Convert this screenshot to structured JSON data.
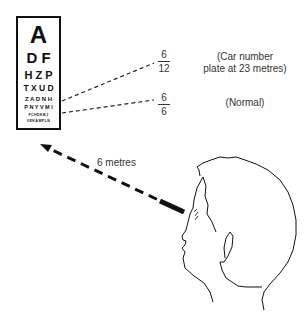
{
  "eye_chart": {
    "rows": [
      {
        "letters": "A"
      },
      {
        "letters": "D F"
      },
      {
        "letters": "H Z P"
      },
      {
        "letters": "T X U D"
      },
      {
        "letters": "Z A D N H"
      },
      {
        "letters": "P N Y V M I"
      },
      {
        "letters": "FCHDKBJ"
      },
      {
        "letters": "VEKAMPLN"
      }
    ]
  },
  "acuity_levels": [
    {
      "numerator": "6",
      "denominator": "12",
      "note_line1": "(Car number",
      "note_line2": "plate at 23 metres)"
    },
    {
      "numerator": "6",
      "denominator": "6",
      "note_line1": "(Normal)",
      "note_line2": ""
    }
  ],
  "distance_label": "6 metres",
  "colors": {
    "ink": "#111111",
    "text": "#333333",
    "background": "#ffffff"
  }
}
